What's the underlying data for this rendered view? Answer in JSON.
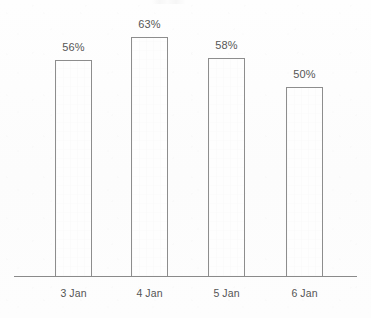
{
  "chart_data": {
    "type": "bar",
    "title": "",
    "subtitle": "",
    "xlabel": "",
    "ylabel": "",
    "categories": [
      "3 Jan",
      "4 Jan",
      "5 Jan",
      "6 Jan"
    ],
    "values": [
      56,
      63,
      58,
      50
    ],
    "data_labels": [
      "56%",
      "63%",
      "58%",
      "50%"
    ],
    "unit": "%",
    "ylim": [
      0,
      63
    ],
    "grid": false,
    "legend": false,
    "legend_position": "none",
    "axis": {
      "x_axis_visible": true,
      "y_axis_visible": false,
      "ticks_visible": false
    },
    "style": {
      "bar_fill": "#fefefe",
      "bar_stroke": "#8d8d8d",
      "axis_color": "#8a8a8a",
      "label_color": "#565656",
      "category_color": "#545454",
      "background": "#fdfdfd"
    },
    "geometry": {
      "baseline_y": 276,
      "axis_left_x": 14,
      "axis_right_x": 357,
      "bar_width": 37,
      "bar_left_x": [
        55,
        131,
        208,
        286
      ],
      "bar_top_y": [
        60,
        37,
        58,
        87
      ]
    }
  }
}
